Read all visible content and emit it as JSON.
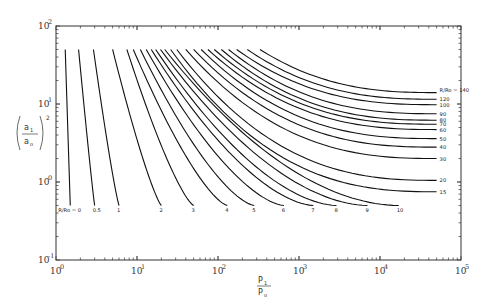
{
  "chart_data": {
    "type": "line",
    "title": "",
    "xlabel": "P1/Po",
    "ylabel": "(a1/ao)^2",
    "xscale": "log",
    "yscale": "log",
    "xlim": [
      1,
      100000
    ],
    "ylim": [
      0.1,
      100
    ],
    "grid": false,
    "legend": "inline curve labels",
    "x_ticks": [
      {
        "base": "10",
        "exp": "0"
      },
      {
        "base": "10",
        "exp": "1"
      },
      {
        "base": "10",
        "exp": "2"
      },
      {
        "base": "10",
        "exp": "3"
      },
      {
        "base": "10",
        "exp": "4"
      },
      {
        "base": "10",
        "exp": "5"
      }
    ],
    "y_ticks": [
      {
        "base": "10",
        "exp": "2"
      },
      {
        "base": "10",
        "exp": "1"
      },
      {
        "base": "10",
        "exp": "0"
      },
      {
        "base": "10",
        "exp": "-1"
      }
    ],
    "parameter_name": "R/Ro",
    "series_label_prefix": "R/Ro = ",
    "series_bottom": [
      {
        "name": "0",
        "x_end": 1.5,
        "y_end": 0.5,
        "x_start": 1.3
      },
      {
        "name": "0.5",
        "x_end": 3.0,
        "y_end": 0.5,
        "x_start": 1.9
      },
      {
        "name": "1",
        "x_end": 6.0,
        "y_end": 0.5,
        "x_start": 2.9
      },
      {
        "name": "2",
        "x_end": 20,
        "y_end": 0.5,
        "x_start": 5.0
      },
      {
        "name": "3",
        "x_end": 50,
        "y_end": 0.5,
        "x_start": 7.5
      },
      {
        "name": "4",
        "x_end": 130,
        "y_end": 0.5,
        "x_start": 9.0
      },
      {
        "name": "5",
        "x_end": 280,
        "y_end": 0.5,
        "x_start": 11.0
      },
      {
        "name": "6",
        "x_end": 650,
        "y_end": 0.5,
        "x_start": 13.0
      },
      {
        "name": "7",
        "x_end": 1500,
        "y_end": 0.5,
        "x_start": 15.0
      },
      {
        "name": "8",
        "x_end": 2900,
        "y_end": 0.5,
        "x_start": 17.0
      },
      {
        "name": "9",
        "x_end": 7000,
        "y_end": 0.5,
        "x_start": 19.5
      },
      {
        "name": "10",
        "x_end": 17000,
        "y_end": 0.5,
        "x_start": 22.0
      }
    ],
    "series_right": [
      {
        "name": "15",
        "x_start": 26,
        "x_end": 50000,
        "y_end": 0.75
      },
      {
        "name": "20",
        "x_start": 31,
        "x_end": 50000,
        "y_end": 1.05
      },
      {
        "name": "30",
        "x_start": 40,
        "x_end": 50000,
        "y_end": 2.0
      },
      {
        "name": "40",
        "x_start": 50,
        "x_end": 50000,
        "y_end": 2.8
      },
      {
        "name": "50",
        "x_start": 62,
        "x_end": 50000,
        "y_end": 3.6
      },
      {
        "name": "60",
        "x_start": 75,
        "x_end": 50000,
        "y_end": 4.7
      },
      {
        "name": "70",
        "x_start": 90,
        "x_end": 50000,
        "y_end": 5.5
      },
      {
        "name": "80",
        "x_start": 110,
        "x_end": 50000,
        "y_end": 6.2
      },
      {
        "name": "90",
        "x_start": 135,
        "x_end": 50000,
        "y_end": 7.5
      },
      {
        "name": "100",
        "x_start": 170,
        "x_end": 50000,
        "y_end": 9.8
      },
      {
        "name": "120",
        "x_start": 230,
        "x_end": 50000,
        "y_end": 11.5
      },
      {
        "name": "140",
        "x_start": 330,
        "x_end": 50000,
        "y_end": 14.0
      }
    ],
    "curve_top_y": 50,
    "label_bottom_R0": "R/Ro = 0",
    "label_right_R140": "R/Ro = 140"
  }
}
